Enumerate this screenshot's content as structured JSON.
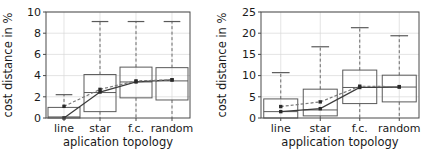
{
  "figure": {
    "panel_count": 2
  },
  "chart_data": [
    {
      "type": "box",
      "panel": "left",
      "title": "",
      "xlabel": "aplication topology",
      "ylabel": "cost distance in %",
      "categories": [
        "line",
        "star",
        "f.c.",
        "random"
      ],
      "xtick_labels": [
        "line",
        "star",
        "f.c.",
        "random"
      ],
      "ytick_labels": [
        "0",
        "2",
        "4",
        "6",
        "8",
        "10"
      ],
      "yticks": [
        0,
        2,
        4,
        6,
        8,
        10
      ],
      "ylim": [
        0,
        10
      ],
      "grid": true,
      "legend": "none",
      "boxes": [
        {
          "category": "line",
          "q1": 0.0,
          "median": 0.1,
          "q3": 1.0,
          "whisker_low": 0.0,
          "whisker_high": 2.2
        },
        {
          "category": "star",
          "q1": 0.6,
          "median": 2.4,
          "q3": 4.1,
          "whisker_low": 0.0,
          "whisker_high": 9.1
        },
        {
          "category": "f.c.",
          "q1": 1.9,
          "median": 3.4,
          "q3": 4.8,
          "whisker_low": 0.0,
          "whisker_high": 9.1
        },
        {
          "category": "random",
          "q1": 1.7,
          "median": 3.5,
          "q3": 4.75,
          "whisker_low": 0.0,
          "whisker_high": 9.1
        }
      ],
      "series": [
        {
          "name": "mean-solid",
          "style": "solid",
          "values": [
            0.0,
            2.45,
            3.4,
            3.6
          ]
        },
        {
          "name": "mean-dashed",
          "style": "dashed",
          "values": [
            1.1,
            2.7,
            3.5,
            3.6
          ]
        }
      ]
    },
    {
      "type": "box",
      "panel": "right",
      "title": "",
      "xlabel": "application topology",
      "ylabel": "cost distance in %",
      "categories": [
        "line",
        "star",
        "f.c.",
        "random"
      ],
      "xtick_labels": [
        "line",
        "star",
        "f.c.",
        "random"
      ],
      "ytick_labels": [
        "0",
        "5",
        "10",
        "15",
        "20",
        "25"
      ],
      "yticks": [
        0,
        5,
        10,
        15,
        20,
        25
      ],
      "ylim": [
        0,
        25
      ],
      "grid": true,
      "legend": "none",
      "boxes": [
        {
          "category": "line",
          "q1": 0.0,
          "median": 1.5,
          "q3": 4.5,
          "whisker_low": 0.0,
          "whisker_high": 10.7
        },
        {
          "category": "star",
          "q1": 0.5,
          "median": 1.9,
          "q3": 6.8,
          "whisker_low": 0.0,
          "whisker_high": 16.8
        },
        {
          "category": "f.c.",
          "q1": 3.4,
          "median": 7.2,
          "q3": 11.3,
          "whisker_low": 0.0,
          "whisker_high": 21.3
        },
        {
          "category": "random",
          "q1": 3.8,
          "median": 7.3,
          "q3": 10.1,
          "whisker_low": 0.0,
          "whisker_high": 19.4
        }
      ],
      "series": [
        {
          "name": "mean-solid",
          "style": "solid",
          "values": [
            1.5,
            2.2,
            7.2,
            7.3
          ]
        },
        {
          "name": "mean-dashed",
          "style": "dashed",
          "values": [
            2.7,
            3.8,
            7.5,
            7.4
          ]
        }
      ]
    }
  ]
}
